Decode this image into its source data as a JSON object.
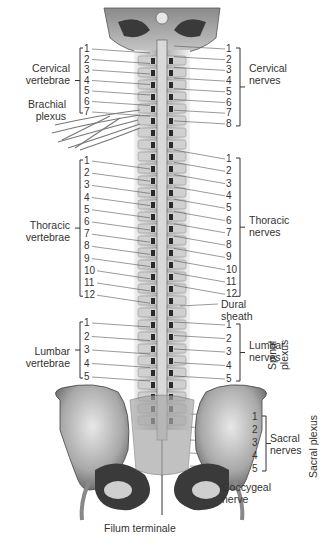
{
  "left_groups": [
    {
      "label": [
        "Cervical",
        "vertebrae"
      ],
      "numbers": [
        "1",
        "2",
        "3",
        "4",
        "5",
        "6",
        "7"
      ]
    },
    {
      "label": [
        "Thoracic",
        "vertebrae"
      ],
      "numbers": [
        "1",
        "2",
        "3",
        "4",
        "5",
        "6",
        "7",
        "8",
        "9",
        "10",
        "11",
        "12"
      ]
    },
    {
      "label": [
        "Lumbar",
        "vertebrae"
      ],
      "numbers": [
        "1",
        "2",
        "3",
        "4",
        "5"
      ]
    }
  ],
  "right_groups": [
    {
      "label": [
        "Cervical",
        "nerves"
      ],
      "numbers": [
        "1",
        "2",
        "3",
        "4",
        "5",
        "6",
        "7",
        "8"
      ]
    },
    {
      "label": [
        "Thoracic",
        "nerves"
      ],
      "numbers": [
        "1",
        "2",
        "3",
        "4",
        "5",
        "6",
        "7",
        "8",
        "9",
        "10",
        "11",
        "12"
      ]
    },
    {
      "label": [
        "Lumbar",
        "nerves"
      ],
      "numbers": [
        "1",
        "2",
        "3",
        "4",
        "5"
      ]
    },
    {
      "label": [
        "Sacral",
        "nerves"
      ],
      "numbers": [
        "1",
        "2",
        "3",
        "4",
        "5"
      ]
    }
  ],
  "labels": {
    "brachial_plexus": [
      "Brachial",
      "plexus"
    ],
    "dural_sheath": [
      "Dural",
      "sheath"
    ],
    "coccygeal_nerve": [
      "Coccygeal",
      "nerve"
    ],
    "filum_terminale": "Filum terminale",
    "spinal_plexus": [
      "Spinal",
      "plexus"
    ],
    "sacral_plexus": "Sacral plexus"
  }
}
